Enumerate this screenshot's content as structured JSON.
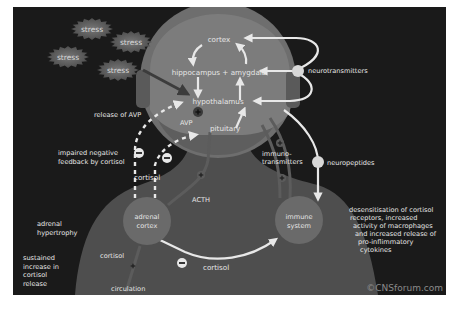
{
  "diagram": {
    "type": "stress-HPA-axis-pathway",
    "colors": {
      "background": "#1a1a1a",
      "page_margin": "#ffffff",
      "head_outer": "#6e6e6e",
      "head_inner": "#7c7c7c",
      "body": "#4e4e4e",
      "organ_circle": "#6a6a6a",
      "arrow": "#e8e8e8",
      "text": "#e6e6e6",
      "stress_burst": "#5a5a5a"
    },
    "stress_bursts": [
      {
        "label": "stress"
      },
      {
        "label": "stress"
      },
      {
        "label": "stress"
      },
      {
        "label": "stress"
      }
    ],
    "brain_regions": {
      "cortex": "cortex",
      "hippocampus_amygdala": "hippocampus + amygdala",
      "hypothalamus": "hypothalamus",
      "pituitary": "pituitary",
      "avp": "AVP"
    },
    "organs": {
      "adrenal_cortex": [
        "adrenal",
        "cortex"
      ],
      "immune_system": [
        "immune",
        "system"
      ]
    },
    "signals": {
      "neurotransmitters": "neurotransmitters",
      "neuropeptides": "neuropeptides",
      "immunotransmitters": [
        "immuno-",
        "transmitters"
      ],
      "acth": "ACTH",
      "cortisol_upper": "cortisol",
      "cortisol_left": "cortisol",
      "cortisol_bottom": "cortisol",
      "circulation": "circulation"
    },
    "annotations": {
      "release_avp": "release of AVP",
      "impaired_feedback": [
        "impaired negative",
        "feedback by cortisol"
      ],
      "adrenal_hypertrophy": [
        "adrenal",
        "hypertrophy"
      ],
      "sustained_increase": [
        "sustained",
        "increase in",
        "cortisol",
        "release"
      ],
      "desensitisation": [
        "desensitisation of cortisol",
        "receptors, increased",
        "activity of macrophages",
        "and increased release of",
        "pro-inflimmatory",
        "cytokines"
      ]
    },
    "symbols": {
      "plus": "+",
      "minus": "−"
    },
    "copyright": "©CNSforum.com"
  }
}
